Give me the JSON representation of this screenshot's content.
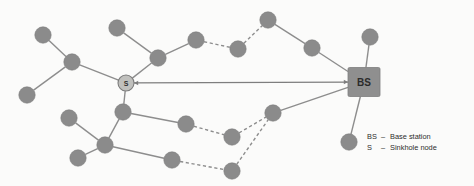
{
  "figure": {
    "background_color": "#fbfbfa",
    "node_color": "#8b8b8b",
    "sink_color": "#c0c0bd",
    "base_station_color": "#8f8f8f",
    "edge_color": "#8d8d8d"
  },
  "labels": {
    "base_station": "BS",
    "sinkhole": "S"
  },
  "legend": {
    "items": [
      {
        "key": "BS",
        "dash": "–",
        "text": "Base station"
      },
      {
        "key": "S",
        "dash": "–",
        "text": "Sinkhole node"
      }
    ]
  },
  "chart_data": {
    "type": "diagram",
    "nodes": [
      {
        "id": "n1",
        "label": "",
        "x": 43,
        "y": 35,
        "kind": "sensor"
      },
      {
        "id": "n2",
        "label": "",
        "x": 72,
        "y": 62,
        "kind": "sensor"
      },
      {
        "id": "n3",
        "label": "",
        "x": 27,
        "y": 95,
        "kind": "sensor"
      },
      {
        "id": "n4",
        "label": "",
        "x": 117,
        "y": 28,
        "kind": "sensor"
      },
      {
        "id": "n5",
        "label": "",
        "x": 158,
        "y": 58,
        "kind": "sensor"
      },
      {
        "id": "n6",
        "label": "",
        "x": 196,
        "y": 40,
        "kind": "sensor"
      },
      {
        "id": "n7",
        "label": "",
        "x": 238,
        "y": 49,
        "kind": "sensor"
      },
      {
        "id": "n8",
        "label": "",
        "x": 268,
        "y": 20,
        "kind": "sensor"
      },
      {
        "id": "n9",
        "label": "",
        "x": 312,
        "y": 48,
        "kind": "sensor"
      },
      {
        "id": "n10",
        "label": "",
        "x": 370,
        "y": 37,
        "kind": "sensor"
      },
      {
        "id": "s",
        "label": "S",
        "x": 126,
        "y": 83,
        "kind": "sinkhole"
      },
      {
        "id": "bs",
        "label": "BS",
        "x": 364,
        "y": 82,
        "kind": "base_station"
      },
      {
        "id": "n11",
        "label": "",
        "x": 123,
        "y": 112,
        "kind": "sensor"
      },
      {
        "id": "n12",
        "label": "",
        "x": 69,
        "y": 118,
        "kind": "sensor"
      },
      {
        "id": "n13",
        "label": "",
        "x": 105,
        "y": 145,
        "kind": "sensor"
      },
      {
        "id": "n14",
        "label": "",
        "x": 78,
        "y": 158,
        "kind": "sensor"
      },
      {
        "id": "n15",
        "label": "",
        "x": 186,
        "y": 124,
        "kind": "sensor"
      },
      {
        "id": "n16",
        "label": "",
        "x": 232,
        "y": 137,
        "kind": "sensor"
      },
      {
        "id": "n17",
        "label": "",
        "x": 273,
        "y": 113,
        "kind": "sensor"
      },
      {
        "id": "n18",
        "label": "",
        "x": 172,
        "y": 160,
        "kind": "sensor"
      },
      {
        "id": "n19",
        "label": "",
        "x": 232,
        "y": 171,
        "kind": "sensor"
      },
      {
        "id": "n20",
        "label": "",
        "x": 349,
        "y": 142,
        "kind": "sensor"
      }
    ],
    "edges": [
      {
        "from": "n1",
        "to": "n2",
        "style": "solid"
      },
      {
        "from": "n3",
        "to": "n2",
        "style": "solid"
      },
      {
        "from": "n2",
        "to": "s",
        "style": "solid"
      },
      {
        "from": "n4",
        "to": "n5",
        "style": "solid"
      },
      {
        "from": "n5",
        "to": "s",
        "style": "solid"
      },
      {
        "from": "n5",
        "to": "n6",
        "style": "solid"
      },
      {
        "from": "n6",
        "to": "n7",
        "style": "dashed"
      },
      {
        "from": "n7",
        "to": "n8",
        "style": "dashed"
      },
      {
        "from": "n8",
        "to": "n9",
        "style": "solid"
      },
      {
        "from": "n9",
        "to": "bs",
        "style": "solid"
      },
      {
        "from": "n10",
        "to": "bs",
        "style": "solid"
      },
      {
        "from": "s",
        "to": "n11",
        "style": "solid"
      },
      {
        "from": "n11",
        "to": "n13",
        "style": "solid"
      },
      {
        "from": "n11",
        "to": "n15",
        "style": "solid"
      },
      {
        "from": "n12",
        "to": "n13",
        "style": "solid"
      },
      {
        "from": "n13",
        "to": "n14",
        "style": "solid"
      },
      {
        "from": "n13",
        "to": "n18",
        "style": "solid"
      },
      {
        "from": "n15",
        "to": "n16",
        "style": "dashed"
      },
      {
        "from": "n16",
        "to": "n17",
        "style": "dashed"
      },
      {
        "from": "n17",
        "to": "bs",
        "style": "solid"
      },
      {
        "from": "n18",
        "to": "n19",
        "style": "dashed"
      },
      {
        "from": "n19",
        "to": "n17",
        "style": "dashed"
      },
      {
        "from": "n20",
        "to": "bs",
        "style": "solid"
      },
      {
        "from": "s",
        "to": "bs",
        "style": "arrow_double"
      }
    ]
  }
}
